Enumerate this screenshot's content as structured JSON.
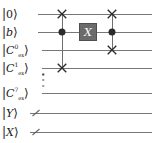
{
  "figure": {
    "kind": "quantum-circuit-diagram",
    "width": 160,
    "height": 143,
    "background": "#ffffff",
    "wire_color": "#777777",
    "control_color": "#2b2b2b",
    "gate_fill": "#6b6b6b",
    "gate_text_color": "#ffffff"
  },
  "wires": [
    {
      "id": "wire-0",
      "name": "ancilla-zero",
      "label_plain": "|0⟩",
      "ket_open": "|",
      "symbol": "0",
      "symbol_italic": false,
      "superscript": "",
      "subscript": "",
      "ket_close": "⟩",
      "y": 14,
      "line_x1": 38,
      "line_x2": 152,
      "bundled": false
    },
    {
      "id": "wire-1",
      "name": "b-register",
      "label_plain": "|b⟩",
      "ket_open": "|",
      "symbol": "b",
      "symbol_italic": true,
      "superscript": "",
      "subscript": "",
      "ket_close": "⟩",
      "y": 32,
      "line_x1": 38,
      "line_x2": 152,
      "bundled": false
    },
    {
      "id": "wire-2",
      "name": "c-ex-0",
      "label_plain": "|C₀ₑₓ⟩",
      "ket_open": "|",
      "symbol": "C",
      "symbol_italic": true,
      "superscript": "0",
      "subscript": "ex",
      "ket_close": "⟩",
      "y": 50,
      "line_x1": 42,
      "line_x2": 152,
      "bundled": false
    },
    {
      "id": "wire-3",
      "name": "c-ex-1",
      "label_plain": "|C¹ₑₓ⟩",
      "ket_open": "|",
      "symbol": "C",
      "symbol_italic": true,
      "superscript": "1",
      "subscript": "ex",
      "ket_close": "⟩",
      "y": 68,
      "line_x1": 42,
      "line_x2": 152,
      "bundled": false
    },
    {
      "id": "wire-4",
      "name": "c-ex-7",
      "label_plain": "|C⁷ₑₓ⟩",
      "ket_open": "|",
      "symbol": "C",
      "symbol_italic": true,
      "superscript": "7",
      "subscript": "ex",
      "ket_close": "⟩",
      "y": 93,
      "line_x1": 42,
      "line_x2": 152,
      "bundled": false
    },
    {
      "id": "wire-5",
      "name": "y-register",
      "label_plain": "|Y⟩",
      "ket_open": "|",
      "symbol": "Y",
      "symbol_italic": true,
      "superscript": "",
      "subscript": "",
      "ket_close": "⟩",
      "y": 113,
      "line_x1": 30,
      "line_x2": 152,
      "bundled": true,
      "slash_x": 36
    },
    {
      "id": "wire-6",
      "name": "x-register",
      "label_plain": "|X⟩",
      "ket_open": "|",
      "symbol": "X",
      "symbol_italic": true,
      "superscript": "",
      "subscript": "",
      "ket_close": "⟩",
      "y": 132,
      "line_x1": 30,
      "line_x2": 152,
      "bundled": true,
      "slash_x": 36
    }
  ],
  "ellipsis": {
    "name": "vertical-ellipsis",
    "glyph": "⋮",
    "x": 43,
    "y": 80,
    "dot_count": 3
  },
  "columns": [
    {
      "id": "col-1",
      "name": "controlled-swap-left",
      "x": 62,
      "line_y1": 14,
      "line_y2": 68,
      "operations": [
        {
          "type": "swap",
          "name": "swap-target-ancilla",
          "wire": 0,
          "y": 14
        },
        {
          "type": "control",
          "name": "control-on-b",
          "wire": 1,
          "y": 32
        },
        {
          "type": "swap",
          "name": "swap-target-c-ex-1",
          "wire": 3,
          "y": 68
        }
      ]
    },
    {
      "id": "col-2",
      "name": "x-gate-column",
      "x": 88,
      "line_y1": 32,
      "line_y2": 32,
      "operations": [
        {
          "type": "gate",
          "name": "pauli-x-gate",
          "wire": 1,
          "y": 32,
          "label": "X"
        }
      ]
    },
    {
      "id": "col-3",
      "name": "controlled-swap-right",
      "x": 112,
      "line_y1": 14,
      "line_y2": 50,
      "operations": [
        {
          "type": "swap",
          "name": "swap-target-ancilla",
          "wire": 0,
          "y": 14
        },
        {
          "type": "control",
          "name": "control-on-b",
          "wire": 1,
          "y": 32
        },
        {
          "type": "swap",
          "name": "swap-target-c-ex-0",
          "wire": 2,
          "y": 50
        }
      ]
    }
  ]
}
